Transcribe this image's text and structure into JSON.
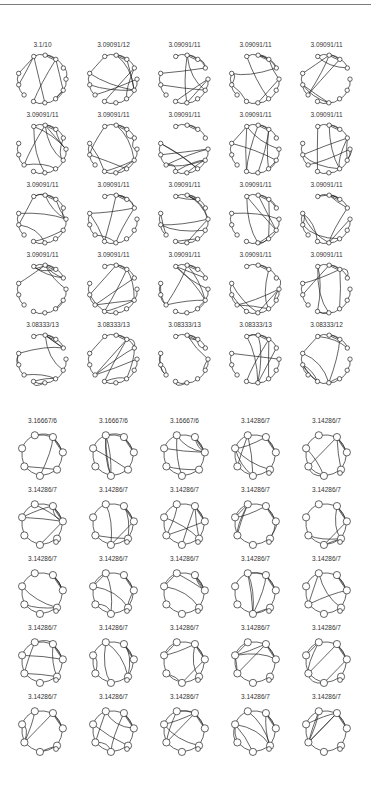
{
  "figure": {
    "top_rule": true,
    "groups": [
      {
        "name": "top-group",
        "label_top": 41,
        "row_spacing": 70,
        "node_count": 12,
        "rows": [
          [
            "3.1/10",
            "3.09091/12",
            "3.09091/11",
            "3.09091/11",
            "3.09091/11"
          ],
          [
            "3.09091/11",
            "3.09091/11",
            "3.09091/11",
            "3.09091/11",
            "3.09091/11"
          ],
          [
            "3.09091/11",
            "3.09091/11",
            "3.09091/11",
            "3.09091/11",
            "3.09091/11"
          ],
          [
            "3.09091/11",
            "3.09091/11",
            "3.09091/11",
            "3.09091/11",
            "3.09091/11"
          ],
          [
            "3.08333/13",
            "3.08333/13",
            "3.08333/13",
            "3.08333/13",
            "3.08333/12"
          ]
        ]
      },
      {
        "name": "bottom-group",
        "label_top": 417,
        "row_spacing": 69,
        "node_count": 7,
        "rows": [
          [
            "3.16667/6",
            "3.16667/6",
            "3.16667/6",
            "3.14286/7",
            "3.14286/7"
          ],
          [
            "3.14286/7",
            "3.14286/7",
            "3.14286/7",
            "3.14286/7",
            "3.14286/7"
          ],
          [
            "3.14286/7",
            "3.14286/7",
            "3.14286/7",
            "3.14286/7",
            "3.14286/7"
          ],
          [
            "3.14286/7",
            "3.14286/7",
            "3.14286/7",
            "3.14286/7",
            "3.14286/7"
          ],
          [
            "3.14286/7",
            "3.14286/7",
            "3.14286/7",
            "3.14286/7",
            "3.14286/7"
          ]
        ]
      }
    ],
    "column_centers": [
      42,
      113,
      184,
      255,
      326
    ]
  }
}
